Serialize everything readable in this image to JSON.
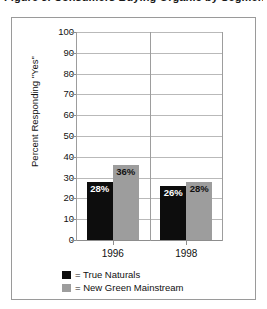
{
  "clipped_caption": "Figure 3. Consumers Buying Organic by Segment",
  "chart_data": {
    "type": "bar",
    "title": "",
    "xlabel": "",
    "ylabel": "Percent Responding \"Yes\"",
    "categories": [
      "1996",
      "1998"
    ],
    "series": [
      {
        "name": "True Naturals",
        "color": "#0d0d0d",
        "values": [
          28,
          26
        ],
        "labels": [
          "28%",
          "26%"
        ]
      },
      {
        "name": "New Green Mainstream",
        "color": "#9d9d9d",
        "values": [
          36,
          28
        ],
        "labels": [
          "36%",
          "28%"
        ]
      }
    ],
    "ylim": [
      0,
      100
    ],
    "ytick_step": 10,
    "yticks": [
      100,
      90,
      80,
      70,
      60,
      50,
      40,
      30,
      20,
      10,
      0
    ],
    "ytick_labels": [
      "100",
      "90",
      "80",
      "70",
      "60",
      "50",
      "40",
      "30",
      "20",
      "10",
      "0"
    ],
    "grid": true,
    "grid_axis": "both",
    "legend_position": "bottom-left",
    "legend_entries": [
      {
        "marker": "black-square",
        "text": "= True Naturals"
      },
      {
        "marker": "gray-square",
        "text": "= New Green Mainstream"
      }
    ]
  }
}
